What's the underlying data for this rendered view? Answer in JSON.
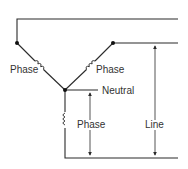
{
  "diagram": {
    "type": "wye-connection",
    "labels": {
      "phase_left": "Phase",
      "phase_right": "Phase",
      "neutral": "Neutral",
      "phase_bottom": "Phase",
      "line": "Line"
    },
    "colors": {
      "stroke": "#2a2a2a",
      "text": "#333333",
      "background": "#ffffff"
    }
  }
}
